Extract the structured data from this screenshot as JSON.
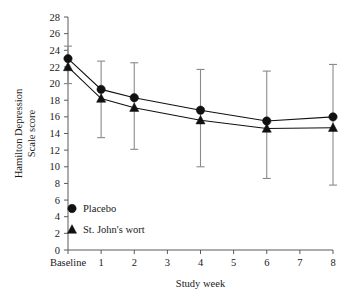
{
  "chart_data": {
    "type": "line",
    "title": "",
    "xlabel": "Study week",
    "ylabel": "Hamilton Depression Scale score",
    "ylabel_line1": "Hamilton Depression",
    "ylabel_line2": "Scale score",
    "ylim": [
      0,
      28
    ],
    "yticks": [
      0,
      2,
      4,
      6,
      8,
      10,
      12,
      14,
      16,
      18,
      20,
      22,
      24,
      26,
      28
    ],
    "ytick_labels": [
      "0",
      "2",
      "4",
      "6",
      "8",
      "10",
      "12",
      "14",
      "16",
      "18",
      "20",
      "22",
      "24",
      "26",
      "28"
    ],
    "xtick_labels": [
      "Baseline",
      "1",
      "2",
      "3",
      "4",
      "5",
      "6",
      "7",
      "8"
    ],
    "categories": [
      "Baseline",
      "1",
      "2",
      "4",
      "6",
      "8"
    ],
    "x": [
      0,
      1,
      2,
      4,
      6,
      8
    ],
    "grid": false,
    "legend_position": "lower left",
    "series": [
      {
        "name": "Placebo",
        "marker": "circle",
        "values": [
          23.0,
          19.3,
          18.3,
          16.8,
          15.5,
          16.0
        ],
        "err_low": [
          20.0,
          13.5,
          12.1,
          10.0,
          8.6,
          7.8
        ],
        "err_high": [
          24.5,
          22.7,
          22.5,
          21.7,
          21.5,
          22.3
        ]
      },
      {
        "name": "St. John's wort",
        "marker": "triangle",
        "values": [
          22.0,
          18.2,
          17.1,
          15.6,
          14.6,
          14.7
        ],
        "err_low": [
          20.0,
          13.5,
          12.1,
          10.0,
          8.6,
          7.8
        ],
        "err_high": [
          24.5,
          22.7,
          22.5,
          21.7,
          21.5,
          22.3
        ]
      }
    ]
  },
  "legend": {
    "items": [
      {
        "label": "Placebo",
        "marker": "circle"
      },
      {
        "label": "St. John's wort",
        "marker": "triangle"
      }
    ]
  },
  "colors": {
    "marker": "#111111",
    "line": "#111111",
    "error_bar": "#8a8a8a",
    "axis": "#5a5a5a",
    "text": "#1a1a1a",
    "background": "#ffffff"
  }
}
